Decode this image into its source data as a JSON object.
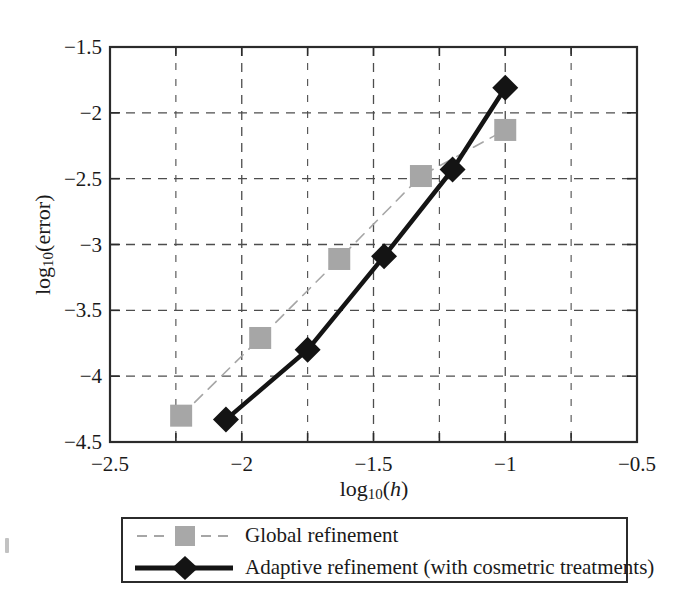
{
  "chart_data": {
    "type": "line",
    "title": "",
    "xlabel": "log10(h)",
    "xlabel_parts": {
      "base": "log",
      "sub": "10",
      "arg": "h"
    },
    "ylabel": "log10(error)",
    "ylabel_parts": {
      "base": "log",
      "sub": "10",
      "arg": "error"
    },
    "xlim": [
      -2.5,
      -0.5
    ],
    "ylim": [
      -4.5,
      -1.5
    ],
    "xticks": [
      -2.5,
      -2,
      -1.5,
      -1,
      -0.5
    ],
    "xtick_labels": [
      "−2.5",
      "−2",
      "−1.5",
      "−1",
      "−0.5"
    ],
    "xminor_ticks": [
      -2.25,
      -1.75,
      -1.25,
      -0.75
    ],
    "yticks": [
      -1.5,
      -2,
      -2.5,
      -3,
      -3.5,
      -4,
      -4.5
    ],
    "ytick_labels": [
      "−1.5",
      "−2",
      "−2.5",
      "−3",
      "−3.5",
      "−4",
      "−4.5"
    ],
    "grid": true,
    "grid_style": "dashed",
    "legend_position": "below-axes",
    "series": [
      {
        "name": "Global refinement",
        "color": "#a6a6a6",
        "marker": "square",
        "line_style": "dashed",
        "line_width": 1.6,
        "points": [
          {
            "x": -2.23,
            "y": -4.3
          },
          {
            "x": -1.93,
            "y": -3.71
          },
          {
            "x": -1.63,
            "y": -3.11
          },
          {
            "x": -1.32,
            "y": -2.48
          },
          {
            "x": -1.0,
            "y": -2.13
          }
        ]
      },
      {
        "name": "Adaptive refinement (with cosmetric treatments)",
        "color": "#141414",
        "marker": "diamond",
        "line_style": "solid",
        "line_width": 4.5,
        "points": [
          {
            "x": -2.06,
            "y": -4.33
          },
          {
            "x": -1.75,
            "y": -3.8
          },
          {
            "x": -1.46,
            "y": -3.09
          },
          {
            "x": -1.2,
            "y": -2.43
          },
          {
            "x": -1.0,
            "y": -1.81
          }
        ]
      }
    ]
  },
  "legend": {
    "entries": [
      {
        "label": "Global refinement"
      },
      {
        "label": "Adaptive refinement (with cosmetric treatments)"
      }
    ]
  },
  "colors": {
    "axis": "#2b2b2b",
    "grid": "#4d4d4d",
    "global_series": "#a6a6a6",
    "adaptive_series": "#141414",
    "background": "#ffffff"
  }
}
